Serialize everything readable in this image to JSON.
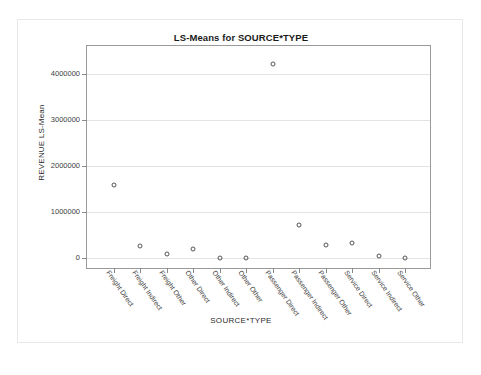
{
  "chart_data": {
    "type": "scatter",
    "title": "LS-Means for SOURCE*TYPE",
    "xlabel": "SOURCE*TYPE",
    "ylabel": "REVENUE LS-Mean",
    "grid": true,
    "legend": "none",
    "ylim": [
      -250000,
      4600000
    ],
    "yticks": [
      0,
      1000000,
      2000000,
      3000000,
      4000000
    ],
    "ytick_labels": [
      "0",
      "1000000",
      "2000000",
      "3000000",
      "4000000"
    ],
    "categories": [
      "Freight Direct",
      "Freight Indirect",
      "Freight Other",
      "Other Direct",
      "Other Indirect",
      "Other Other",
      "Passenger Direct",
      "Passenger Indirect",
      "Passenger Other",
      "Service Direct",
      "Service Indirect",
      "Service Other"
    ],
    "values": [
      1590000,
      280000,
      90000,
      210000,
      20000,
      5000,
      4200000,
      725000,
      285000,
      330000,
      45000,
      5000
    ],
    "marker": "open-circle",
    "marker_color": "#555555"
  }
}
